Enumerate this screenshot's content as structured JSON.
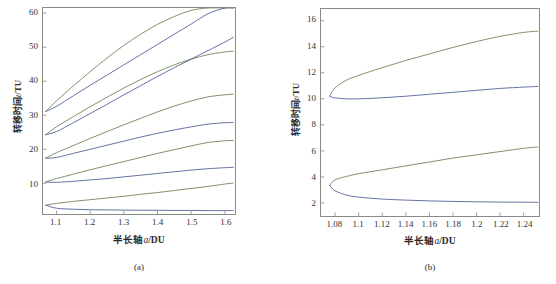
{
  "figure": {
    "panels": [
      {
        "id": "a",
        "caption": "(a)",
        "xlabel_cn": "半长轴",
        "xlabel_var": "a",
        "xlabel_unit": "/DU",
        "ylabel_cn": "转移时间",
        "ylabel_var": "t",
        "ylabel_unit": "/TU"
      },
      {
        "id": "b",
        "caption": "(b)",
        "xlabel_cn": "半长轴",
        "xlabel_var": "a",
        "xlabel_unit": "/DU",
        "ylabel_cn": "转移时间",
        "ylabel_var": "t",
        "ylabel_unit": "/TU"
      }
    ]
  },
  "colors": {
    "blue": "#4a5a96",
    "green": "#6d7d4e",
    "frame": "#8a8a8a",
    "text": "#2b2b2b"
  },
  "chart_data": [
    {
      "type": "line",
      "panel": "(a)",
      "title": "",
      "xlabel": "半长轴a/DU",
      "ylabel": "转移时间t/TU",
      "xlim": [
        1.06,
        1.63
      ],
      "ylim": [
        1.0,
        61.5
      ],
      "xticks": [
        1.1,
        1.2,
        1.3,
        1.4,
        1.5,
        1.6
      ],
      "xtick_labels": [
        "1.1",
        "1.2",
        "1.3",
        "1.4",
        "1.5",
        "1.6"
      ],
      "yticks": [
        10,
        20,
        30,
        40,
        50,
        60
      ],
      "ytick_labels": [
        "10",
        "20",
        "30",
        "40",
        "50",
        "60"
      ],
      "grid": false,
      "legend": "none",
      "series": [
        {
          "name": "branch-1-green-upper",
          "color": "#6d7d4e",
          "x": [
            1.068,
            1.1,
            1.15,
            1.2,
            1.25,
            1.3,
            1.35,
            1.4,
            1.45,
            1.5,
            1.55,
            1.6,
            1.625
          ],
          "values": [
            3.6,
            4.1,
            4.7,
            5.2,
            5.7,
            6.2,
            6.8,
            7.3,
            7.9,
            8.5,
            9.1,
            9.8,
            10.1
          ]
        },
        {
          "name": "branch-1-blue-lower",
          "color": "#4a5a96",
          "x": [
            1.068,
            1.1,
            1.15,
            1.2,
            1.25,
            1.3,
            1.35,
            1.4,
            1.45,
            1.5,
            1.55,
            1.6,
            1.625
          ],
          "values": [
            3.6,
            2.7,
            2.4,
            2.25,
            2.2,
            2.15,
            2.1,
            2.1,
            2.05,
            2.05,
            2.0,
            2.0,
            2.0
          ]
        },
        {
          "name": "branch-2-green-upper",
          "color": "#6d7d4e",
          "x": [
            1.068,
            1.1,
            1.15,
            1.2,
            1.25,
            1.3,
            1.35,
            1.4,
            1.45,
            1.5,
            1.55,
            1.6,
            1.625
          ],
          "values": [
            10.4,
            11.4,
            12.7,
            14.0,
            15.2,
            16.4,
            17.6,
            18.8,
            19.9,
            21.0,
            22.0,
            22.5,
            22.6
          ]
        },
        {
          "name": "branch-2-blue-lower",
          "color": "#4a5a96",
          "x": [
            1.068,
            1.1,
            1.15,
            1.2,
            1.25,
            1.3,
            1.35,
            1.4,
            1.45,
            1.5,
            1.55,
            1.6,
            1.625
          ],
          "values": [
            10.4,
            10.3,
            10.6,
            11.0,
            11.4,
            11.9,
            12.4,
            12.9,
            13.4,
            13.9,
            14.3,
            14.6,
            14.7
          ]
        },
        {
          "name": "branch-3-green-upper",
          "color": "#6d7d4e",
          "x": [
            1.068,
            1.1,
            1.15,
            1.2,
            1.25,
            1.3,
            1.35,
            1.4,
            1.45,
            1.5,
            1.55,
            1.6,
            1.625
          ],
          "values": [
            17.4,
            19.0,
            21.1,
            23.2,
            25.2,
            27.2,
            29.1,
            31.0,
            32.7,
            34.2,
            35.4,
            36.0,
            36.2
          ]
        },
        {
          "name": "branch-3-blue-lower",
          "color": "#4a5a96",
          "x": [
            1.068,
            1.1,
            1.15,
            1.2,
            1.25,
            1.3,
            1.35,
            1.4,
            1.45,
            1.5,
            1.55,
            1.6,
            1.625
          ],
          "values": [
            17.4,
            17.6,
            18.8,
            20.0,
            21.2,
            22.4,
            23.6,
            24.7,
            25.7,
            26.6,
            27.4,
            27.8,
            27.9
          ]
        },
        {
          "name": "branch-4-green-upper",
          "color": "#6d7d4e",
          "x": [
            1.068,
            1.1,
            1.15,
            1.2,
            1.25,
            1.3,
            1.35,
            1.4,
            1.45,
            1.5,
            1.55,
            1.6,
            1.625
          ],
          "values": [
            24.3,
            26.6,
            29.6,
            32.5,
            35.3,
            38.0,
            40.5,
            42.8,
            44.8,
            46.5,
            47.8,
            48.6,
            48.8
          ]
        },
        {
          "name": "branch-4-blue-lower",
          "color": "#4a5a96",
          "x": [
            1.068,
            1.1,
            1.15,
            1.2,
            1.25,
            1.3,
            1.35,
            1.4,
            1.45,
            1.5,
            1.55,
            1.6,
            1.625
          ],
          "values": [
            24.3,
            25.2,
            27.8,
            30.5,
            33.2,
            36.0,
            38.7,
            41.4,
            44.0,
            46.5,
            49.0,
            51.5,
            52.9
          ]
        },
        {
          "name": "branch-5-green-upper",
          "color": "#6d7d4e",
          "x": [
            1.068,
            1.1,
            1.15,
            1.2,
            1.25,
            1.3,
            1.35,
            1.4,
            1.45,
            1.5,
            1.55,
            1.6,
            1.625
          ],
          "values": [
            31.1,
            34.2,
            38.6,
            42.8,
            46.8,
            50.5,
            53.8,
            56.7,
            59.0,
            60.8,
            61.5,
            61.5,
            61.5
          ]
        },
        {
          "name": "branch-5-blue-lower",
          "color": "#4a5a96",
          "x": [
            1.068,
            1.1,
            1.15,
            1.2,
            1.25,
            1.3,
            1.35,
            1.4,
            1.45,
            1.5,
            1.55,
            1.6,
            1.625
          ],
          "values": [
            31.1,
            32.6,
            35.7,
            38.8,
            41.8,
            44.8,
            47.8,
            50.8,
            53.8,
            56.8,
            59.8,
            61.5,
            61.5
          ]
        }
      ]
    },
    {
      "type": "line",
      "panel": "(b)",
      "title": "",
      "xlabel": "半长轴a/DU",
      "ylabel": "转移时间t/TU",
      "xlim": [
        1.068,
        1.253
      ],
      "ylim": [
        1.0,
        16.9
      ],
      "xticks": [
        1.08,
        1.1,
        1.12,
        1.14,
        1.16,
        1.18,
        1.2,
        1.22,
        1.24
      ],
      "xtick_labels": [
        "1.08",
        "1.1",
        "1.12",
        "1.14",
        "1.16",
        "1.18",
        "1.2",
        "1.22",
        "1.24"
      ],
      "yticks": [
        2,
        4,
        6,
        8,
        10,
        12,
        14,
        16
      ],
      "ytick_labels": [
        "2",
        "4",
        "6",
        "8",
        "10",
        "12",
        "14",
        "16"
      ],
      "grid": false,
      "legend": "none",
      "series": [
        {
          "name": "lower-branch-green-upper",
          "color": "#6d7d4e",
          "x": [
            1.0755,
            1.078,
            1.082,
            1.09,
            1.1,
            1.12,
            1.14,
            1.16,
            1.18,
            1.2,
            1.22,
            1.24,
            1.252
          ],
          "values": [
            3.35,
            3.65,
            3.85,
            4.05,
            4.25,
            4.55,
            4.85,
            5.15,
            5.45,
            5.7,
            5.95,
            6.2,
            6.3
          ]
        },
        {
          "name": "lower-branch-blue-lower",
          "color": "#4a5a96",
          "x": [
            1.0755,
            1.078,
            1.082,
            1.09,
            1.1,
            1.12,
            1.14,
            1.16,
            1.18,
            1.2,
            1.22,
            1.24,
            1.252
          ],
          "values": [
            3.35,
            3.05,
            2.85,
            2.6,
            2.45,
            2.3,
            2.22,
            2.16,
            2.12,
            2.09,
            2.07,
            2.06,
            2.05
          ]
        },
        {
          "name": "upper-branch-green-upper",
          "color": "#6d7d4e",
          "x": [
            1.0755,
            1.078,
            1.082,
            1.09,
            1.1,
            1.12,
            1.14,
            1.16,
            1.18,
            1.2,
            1.22,
            1.24,
            1.252
          ],
          "values": [
            10.2,
            10.65,
            11.0,
            11.45,
            11.8,
            12.4,
            12.95,
            13.45,
            13.95,
            14.4,
            14.8,
            15.1,
            15.2
          ]
        },
        {
          "name": "upper-branch-blue-lower",
          "color": "#4a5a96",
          "x": [
            1.0755,
            1.078,
            1.082,
            1.09,
            1.1,
            1.12,
            1.14,
            1.16,
            1.18,
            1.2,
            1.22,
            1.24,
            1.252
          ],
          "values": [
            10.2,
            10.1,
            10.05,
            10.0,
            10.0,
            10.08,
            10.2,
            10.35,
            10.5,
            10.65,
            10.8,
            10.9,
            10.95
          ]
        }
      ]
    }
  ]
}
